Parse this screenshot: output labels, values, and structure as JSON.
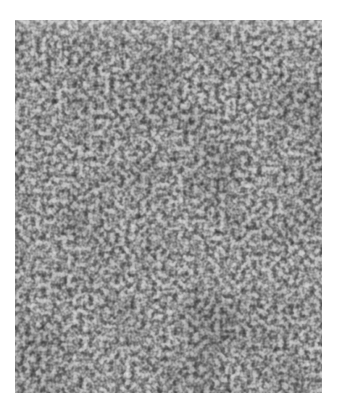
{
  "image": {
    "subject": "Solar granulation photograph (grayscale)",
    "frame": {
      "x": 15,
      "y": 20,
      "width": 307,
      "height": 373
    },
    "background_color": "#ffffff",
    "colors": {
      "cell_bright": "#d9d9d9",
      "lane_dark": "#3a3a3a",
      "mid_gray": "#8c8c8c",
      "bright_patch": "#f2f2f2"
    },
    "features": [
      {
        "type": "bright-patch",
        "position": "bottom-center",
        "cx": 165,
        "cy": 393
      }
    ]
  }
}
